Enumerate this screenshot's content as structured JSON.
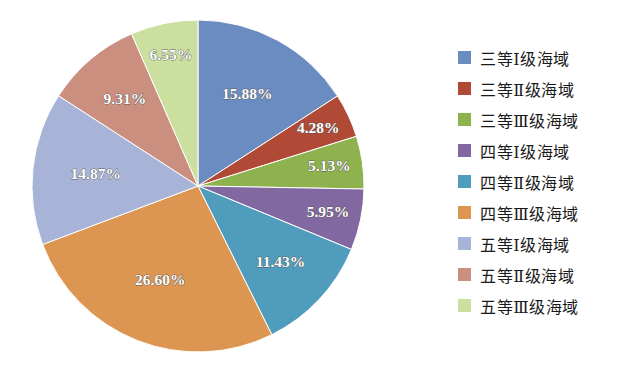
{
  "chart_data": {
    "type": "pie",
    "title": "",
    "subtitle": "",
    "xlabel": "",
    "ylabel": "",
    "grid": false,
    "legend_position": "right",
    "start_angle_deg": 0,
    "direction": "clockwise",
    "unit": "%",
    "categories": [
      "三等Ⅰ级海域",
      "三等Ⅱ级海域",
      "三等Ⅲ级海域",
      "四等Ⅰ级海域",
      "四等Ⅱ级海域",
      "四等Ⅲ级海域",
      "五等Ⅰ级海域",
      "五等Ⅱ级海域",
      "五等Ⅲ级海域"
    ],
    "values": [
      15.88,
      4.28,
      5.13,
      5.95,
      11.43,
      26.6,
      14.87,
      9.31,
      6.55
    ],
    "labels": [
      "15.88%",
      "4.28%",
      "5.13%",
      "5.95%",
      "11.43%",
      "26.60%",
      "14.87%",
      "9.31%",
      "6.55%"
    ],
    "colors": [
      "#6b8cc0",
      "#b04a36",
      "#8db24e",
      "#8268a0",
      "#4f9cbd",
      "#dd9552",
      "#a7b4d8",
      "#cb8f80",
      "#cbdf9f"
    ],
    "total": 100.0
  },
  "legend": {
    "items": [
      {
        "label": "三等Ⅰ级海域",
        "color": "#6b8cc0"
      },
      {
        "label": "三等Ⅱ级海域",
        "color": "#b04a36"
      },
      {
        "label": "三等Ⅲ级海域",
        "color": "#8db24e"
      },
      {
        "label": "四等Ⅰ级海域",
        "color": "#8268a0"
      },
      {
        "label": "四等Ⅱ级海域",
        "color": "#4f9cbd"
      },
      {
        "label": "四等Ⅲ级海域",
        "color": "#dd9552"
      },
      {
        "label": "五等Ⅰ级海域",
        "color": "#a7b4d8"
      },
      {
        "label": "五等Ⅱ级海域",
        "color": "#cb8f80"
      },
      {
        "label": "五等Ⅲ级海域",
        "color": "#cbdf9f"
      }
    ]
  }
}
